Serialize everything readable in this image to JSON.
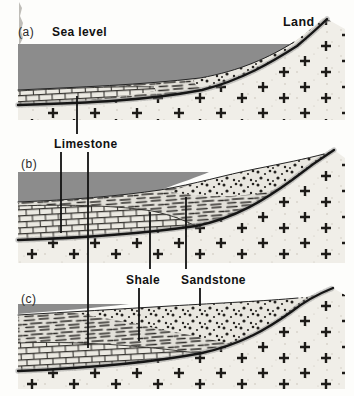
{
  "diagram": {
    "panels": [
      {
        "label": "(a)"
      },
      {
        "label": "(b)"
      },
      {
        "label": "(c)"
      }
    ],
    "annotations": {
      "sea_level": "Sea level",
      "land": "Land",
      "limestone": "Limestone",
      "shale": "Shale",
      "sandstone": "Sandstone"
    },
    "colors": {
      "water": "#8c8c8c",
      "ink": "#161616",
      "limestone_bg": "#ebe9e2",
      "shale_bg": "#e2e0d9",
      "sandstone_bg": "#e9e7e0",
      "basement_bg": "#f0eee8",
      "speckle": "#c7c2b7",
      "paper": "#fdfdfb"
    }
  }
}
